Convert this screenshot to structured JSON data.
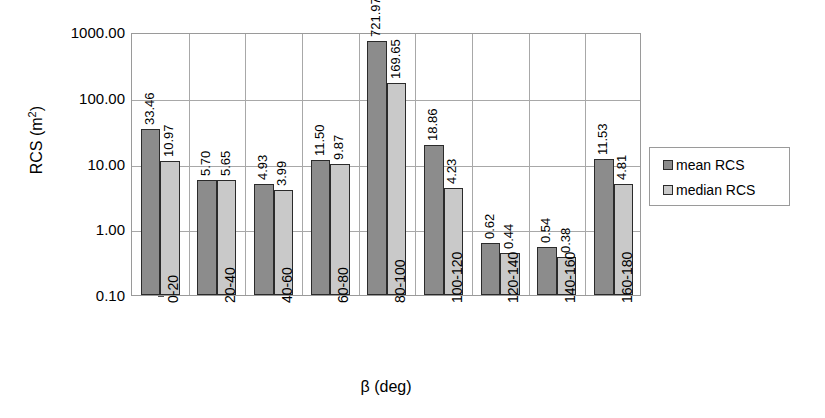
{
  "chart_data": {
    "type": "bar",
    "title": "",
    "xlabel": "β (deg)",
    "ylabel": "RCS (m²)",
    "yscale": "log",
    "ylim": [
      0.1,
      1000.0
    ],
    "ytick_labels": [
      "1000.00",
      "100.00",
      "10.00",
      "1.00",
      "0.10"
    ],
    "ytick_values": [
      1000,
      100,
      10,
      1,
      0.1
    ],
    "grid": "horizontal-and-vertical",
    "legend_position": "right",
    "categories": [
      "0-20",
      "20-40",
      "40-60",
      "60-80",
      "80-100",
      "100-120",
      "120-140",
      "140-160",
      "160-180"
    ],
    "series": [
      {
        "name": "mean RCS",
        "color": "#8c8c8c",
        "values": [
          33.46,
          5.7,
          4.93,
          11.5,
          721.97,
          18.86,
          0.62,
          0.54,
          11.53
        ],
        "labels": [
          "33.46",
          "5.70",
          "4.93",
          "11.50",
          "721.97",
          "18.86",
          "0.62",
          "0.54",
          "11.53"
        ]
      },
      {
        "name": "median RCS",
        "color": "#c9c9c9",
        "values": [
          10.97,
          5.65,
          3.99,
          9.87,
          169.65,
          4.23,
          0.44,
          0.38,
          4.81
        ],
        "labels": [
          "10.97",
          "5.65",
          "3.99",
          "9.87",
          "169.65",
          "4.23",
          "0.44",
          "0.38",
          "4.81"
        ]
      }
    ]
  },
  "axis": {
    "y_title_prefix": "RCS (m",
    "y_title_exponent": "2",
    "y_title_suffix": ")",
    "x_title": "β (deg)"
  },
  "legend": {
    "entries": [
      {
        "label": "mean RCS",
        "swatch": "mean"
      },
      {
        "label": "median RCS",
        "swatch": "median"
      }
    ]
  }
}
